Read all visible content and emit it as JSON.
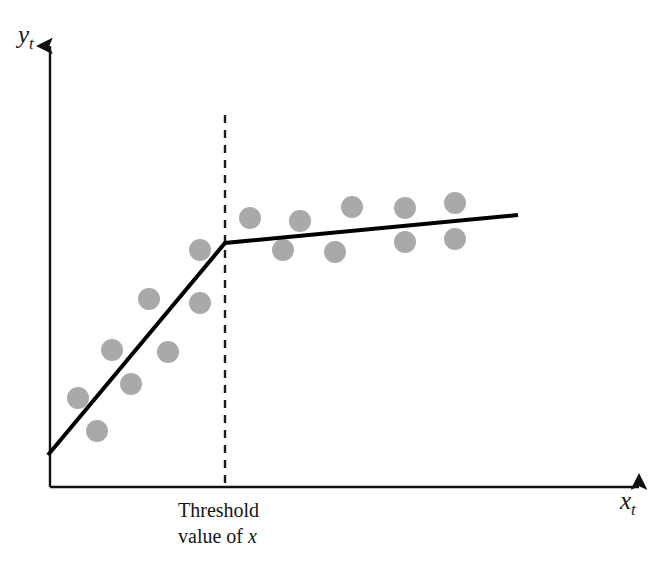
{
  "figure": {
    "title": "",
    "background_color": "#ffffff",
    "width": 659,
    "height": 567
  },
  "axes": {
    "y_label_main": "y",
    "y_label_sub": "t",
    "x_label_main": "x",
    "x_label_sub": "t",
    "axis_color": "#111111",
    "origin": {
      "x": 50,
      "y": 487
    },
    "y_axis_top": {
      "x": 50,
      "y": 40
    },
    "x_axis_right": {
      "x": 645,
      "y": 487
    }
  },
  "annotations": {
    "threshold_line_1": "Threshold",
    "threshold_line_2_prefix": "value of ",
    "threshold_line_2_var": "x",
    "threshold_x": 225,
    "threshold_dash_top": 115,
    "threshold_dash_bottom": 487,
    "dash_color": "#1a1a1a"
  },
  "chart_data": {
    "type": "scatter",
    "title": "",
    "xlabel": "x_t",
    "ylabel": "y_t",
    "grid": false,
    "legend": "none",
    "axis_ticks": [],
    "note": "Piecewise-linear (threshold / kinked) regression: steep slope below the threshold value of x, flat slope above it.",
    "marker": {
      "shape": "circle",
      "color": "#a9a9a9",
      "radius_px": 11
    },
    "fit_line": {
      "type": "piecewise-linear",
      "color": "#000000",
      "width_px": 4,
      "points": [
        {
          "x": 48,
          "y": 455
        },
        {
          "x": 225,
          "y": 243
        },
        {
          "x": 518,
          "y": 215
        }
      ],
      "segments": [
        {
          "name": "below-threshold",
          "slope": "steep-positive"
        },
        {
          "name": "above-threshold",
          "slope": "shallow-positive"
        }
      ]
    },
    "points_below_threshold": [
      {
        "x": 78,
        "y": 398
      },
      {
        "x": 97,
        "y": 431
      },
      {
        "x": 112,
        "y": 350
      },
      {
        "x": 131,
        "y": 384
      },
      {
        "x": 149,
        "y": 299
      },
      {
        "x": 168,
        "y": 352
      },
      {
        "x": 200,
        "y": 303
      },
      {
        "x": 200,
        "y": 250
      }
    ],
    "points_above_threshold": [
      {
        "x": 250,
        "y": 218
      },
      {
        "x": 283,
        "y": 250
      },
      {
        "x": 300,
        "y": 221
      },
      {
        "x": 335,
        "y": 252
      },
      {
        "x": 352,
        "y": 207
      },
      {
        "x": 405,
        "y": 208
      },
      {
        "x": 405,
        "y": 242
      },
      {
        "x": 455,
        "y": 203
      },
      {
        "x": 455,
        "y": 239
      }
    ]
  }
}
